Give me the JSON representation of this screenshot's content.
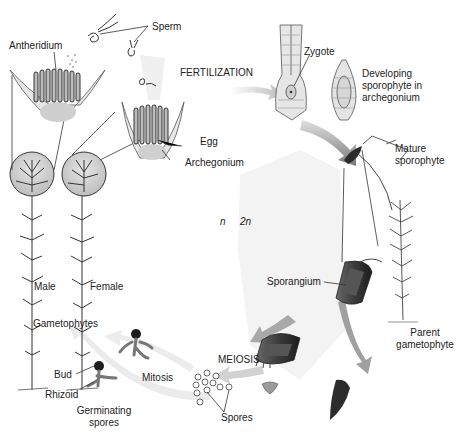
{
  "diagram": {
    "ploidy": {
      "haploid": "n",
      "diploid": "2n"
    },
    "stages": {
      "fertilization": "FERTILIZATION",
      "meiosis": "MEIOSIS",
      "mitosis": "Mitosis"
    },
    "labels": {
      "sperm": "Sperm",
      "antheridium": "Antheridium",
      "egg": "Egg",
      "archegonium": "Archegonium",
      "zygote": "Zygote",
      "developing_sporophyte": "Developing\nsporophyte in\narchegonium",
      "mature_sporophyte": "Mature\nsporophyte",
      "sporangium": "Sporangium",
      "parent_gametophyte": "Parent\ngametophyte",
      "spores": "Spores",
      "germinating_spores": "Germinating\nspores",
      "bud": "Bud",
      "rhizoid": "Rhizoid",
      "male": "Male",
      "female": "Female",
      "gametophytes": "Gametophytes"
    },
    "colors": {
      "ink": "#222222",
      "arrow": "#9a9a9a",
      "arrow_light": "#e4e4e4",
      "diploid_zone": "#f2f2f2",
      "capsule_dark": "#3a3a3a",
      "gametangia_fill": "#d8d8d8"
    }
  }
}
